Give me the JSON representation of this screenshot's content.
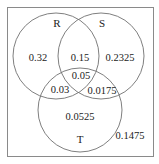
{
  "diagram": {
    "type": "venn-3",
    "sets": [
      {
        "id": "R",
        "label": "R"
      },
      {
        "id": "S",
        "label": "S"
      },
      {
        "id": "T",
        "label": "T"
      }
    ],
    "regions": {
      "R_only": "0.32",
      "S_only": "0.2325",
      "T_only": "0.0525",
      "R_and_S_only": "0.15",
      "R_and_T_only": "0.03",
      "S_and_T_only": "0.0175",
      "R_S_T": "0.05",
      "outside": "0.1475"
    },
    "colors": {
      "stroke": "#707070",
      "text": "#222222",
      "background": "#ffffff"
    }
  }
}
